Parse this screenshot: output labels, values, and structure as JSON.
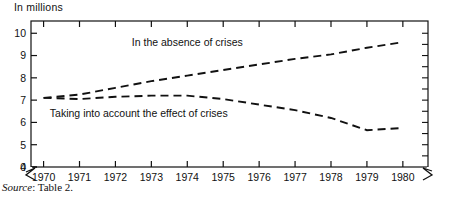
{
  "figure": {
    "axis_title": "In millions",
    "source_note_label": "Source",
    "source_note_sep": ":",
    "source_note_value": "Table 2."
  },
  "chart_data": {
    "type": "line",
    "title": "",
    "subtitle": "",
    "xlabel": "",
    "ylabel": "In millions",
    "x": [
      1970,
      1971,
      1972,
      1973,
      1974,
      1975,
      1976,
      1977,
      1978,
      1979,
      1980
    ],
    "xticklabels": [
      "1970",
      "1971",
      "1972",
      "1973",
      "1974",
      "1975",
      "1976",
      "1977",
      "1978",
      "1979",
      "1980"
    ],
    "yticklabels": [
      "0",
      "4",
      "5",
      "6",
      "7",
      "8",
      "9",
      "10"
    ],
    "yticks": [
      0,
      4,
      5,
      6,
      7,
      8,
      9,
      10
    ],
    "ylim": [
      4,
      10.55
    ],
    "xlim": [
      1969.65,
      1980.7
    ],
    "y_axis_break": true,
    "x_axis_break": true,
    "grid": false,
    "legend": "inline-annotations",
    "linestyle": "dashed",
    "series": [
      {
        "name": "In the absence of crises",
        "values": [
          7.1,
          7.25,
          7.55,
          7.85,
          8.1,
          8.35,
          8.6,
          8.85,
          9.05,
          9.35,
          9.6
        ],
        "label_x": 1974.0,
        "label_y": 9.45
      },
      {
        "name": "Taking into account the effect of crises",
        "values": [
          7.1,
          7.05,
          7.15,
          7.2,
          7.2,
          7.05,
          6.8,
          6.55,
          6.2,
          5.65,
          5.75
        ],
        "label_x": 1972.65,
        "label_y": 6.25
      }
    ],
    "annotations": [
      {
        "text": "In the absence of crises",
        "x": 1974.0,
        "y": 9.45
      },
      {
        "text": "Taking into account the effect of crises",
        "x": 1972.65,
        "y": 6.25
      }
    ]
  }
}
